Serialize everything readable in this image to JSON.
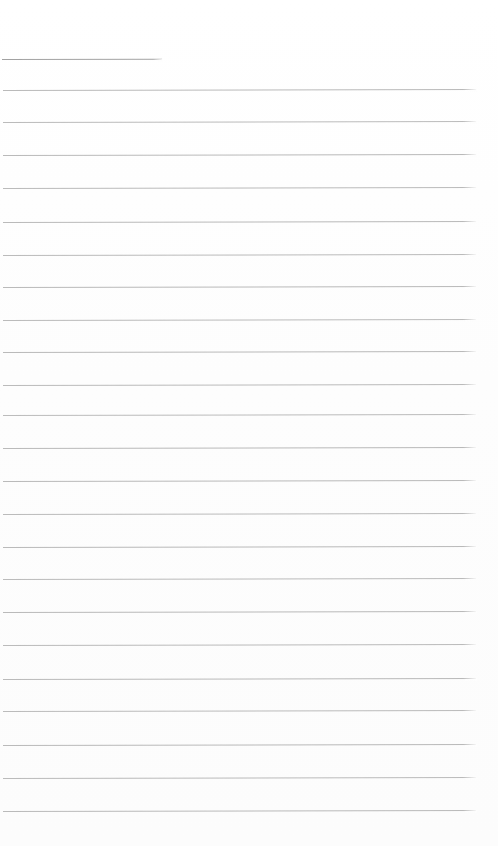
{
  "page": {
    "width": 498,
    "height": 846,
    "background_color": "#fdfdfd",
    "written_text": "",
    "top_margin_px": 58,
    "bottom_margin_px": 35
  },
  "ruling": {
    "line_color": "#b0b0b0",
    "first_line_color": "#9b9b9b",
    "line_thickness_px": 1,
    "line_count": 24,
    "line_spacing_px": 32.65,
    "first_line_top_px": 59,
    "last_line_top_px": 811,
    "left_inset_px": 3,
    "full_line_right_px": 476,
    "first_line_right_px": 162,
    "slope_deg": -0.12,
    "lines": [
      {
        "index": 1,
        "top": 59,
        "left": 2,
        "right": 162,
        "color": "#9b9b9b",
        "opacity": 0.92,
        "full_width": false
      },
      {
        "index": 2,
        "top": 90,
        "left": 3,
        "right": 476,
        "color": "#b0b0b0",
        "opacity": 0.88,
        "full_width": true
      },
      {
        "index": 3,
        "top": 122,
        "left": 3,
        "right": 476,
        "color": "#b0b0b0",
        "opacity": 0.86,
        "full_width": true
      },
      {
        "index": 4,
        "top": 155,
        "left": 3,
        "right": 476,
        "color": "#b0b0b0",
        "opacity": 0.88,
        "full_width": true
      },
      {
        "index": 5,
        "top": 188,
        "left": 3,
        "right": 476,
        "color": "#b0b0b0",
        "opacity": 0.86,
        "full_width": true
      },
      {
        "index": 6,
        "top": 222,
        "left": 3,
        "right": 476,
        "color": "#b0b0b0",
        "opacity": 0.88,
        "full_width": true
      },
      {
        "index": 7,
        "top": 255,
        "left": 3,
        "right": 476,
        "color": "#b0b0b0",
        "opacity": 0.86,
        "full_width": true
      },
      {
        "index": 8,
        "top": 287,
        "left": 3,
        "right": 476,
        "color": "#b0b0b0",
        "opacity": 0.88,
        "full_width": true
      },
      {
        "index": 9,
        "top": 320,
        "left": 3,
        "right": 476,
        "color": "#b0b0b0",
        "opacity": 0.86,
        "full_width": true
      },
      {
        "index": 10,
        "top": 352,
        "left": 3,
        "right": 476,
        "color": "#b0b0b0",
        "opacity": 0.88,
        "full_width": true
      },
      {
        "index": 11,
        "top": 385,
        "left": 3,
        "right": 476,
        "color": "#b0b0b0",
        "opacity": 0.86,
        "full_width": true
      },
      {
        "index": 12,
        "top": 415,
        "left": 3,
        "right": 476,
        "color": "#b0b0b0",
        "opacity": 0.85,
        "full_width": true
      },
      {
        "index": 13,
        "top": 448,
        "left": 3,
        "right": 476,
        "color": "#b0b0b0",
        "opacity": 0.88,
        "full_width": true
      },
      {
        "index": 14,
        "top": 481,
        "left": 3,
        "right": 476,
        "color": "#b0b0b0",
        "opacity": 0.88,
        "full_width": true
      },
      {
        "index": 15,
        "top": 514,
        "left": 3,
        "right": 476,
        "color": "#b0b0b0",
        "opacity": 0.86,
        "full_width": true
      },
      {
        "index": 16,
        "top": 547,
        "left": 3,
        "right": 476,
        "color": "#b0b0b0",
        "opacity": 0.88,
        "full_width": true
      },
      {
        "index": 17,
        "top": 579,
        "left": 3,
        "right": 476,
        "color": "#b0b0b0",
        "opacity": 0.86,
        "full_width": true
      },
      {
        "index": 18,
        "top": 612,
        "left": 3,
        "right": 476,
        "color": "#b0b0b0",
        "opacity": 0.88,
        "full_width": true
      },
      {
        "index": 19,
        "top": 645,
        "left": 3,
        "right": 476,
        "color": "#b0b0b0",
        "opacity": 0.86,
        "full_width": true
      },
      {
        "index": 20,
        "top": 679,
        "left": 3,
        "right": 476,
        "color": "#b0b0b0",
        "opacity": 0.88,
        "full_width": true
      },
      {
        "index": 21,
        "top": 711,
        "left": 3,
        "right": 476,
        "color": "#b0b0b0",
        "opacity": 0.86,
        "full_width": true
      },
      {
        "index": 22,
        "top": 745,
        "left": 3,
        "right": 476,
        "color": "#b0b0b0",
        "opacity": 0.88,
        "full_width": true
      },
      {
        "index": 23,
        "top": 778,
        "left": 3,
        "right": 476,
        "color": "#b0b0b0",
        "opacity": 0.86,
        "full_width": true
      },
      {
        "index": 24,
        "top": 811,
        "left": 3,
        "right": 476,
        "color": "#b0b0b0",
        "opacity": 0.88,
        "full_width": true
      }
    ]
  }
}
